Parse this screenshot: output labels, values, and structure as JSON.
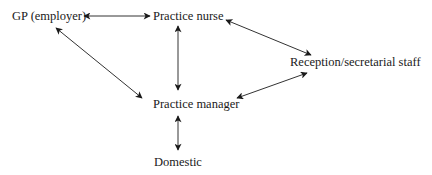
{
  "diagram": {
    "type": "organizational-relationship",
    "nodes": [
      {
        "id": "gp",
        "label": "GP (employer)"
      },
      {
        "id": "nurse",
        "label": "Practice nurse"
      },
      {
        "id": "reception",
        "label": "Reception/secretarial staff"
      },
      {
        "id": "manager",
        "label": "Practice manager"
      },
      {
        "id": "domestic",
        "label": "Domestic"
      }
    ],
    "edges": [
      {
        "from": "gp",
        "to": "nurse",
        "direction": "bidirectional"
      },
      {
        "from": "gp",
        "to": "manager",
        "direction": "bidirectional"
      },
      {
        "from": "nurse",
        "to": "manager",
        "direction": "bidirectional"
      },
      {
        "from": "nurse",
        "to": "reception",
        "direction": "bidirectional"
      },
      {
        "from": "reception",
        "to": "manager",
        "direction": "bidirectional"
      },
      {
        "from": "manager",
        "to": "domestic",
        "direction": "bidirectional"
      }
    ],
    "colors": {
      "line": "#333333",
      "text": "#1a1a1a",
      "background": "#ffffff"
    }
  }
}
